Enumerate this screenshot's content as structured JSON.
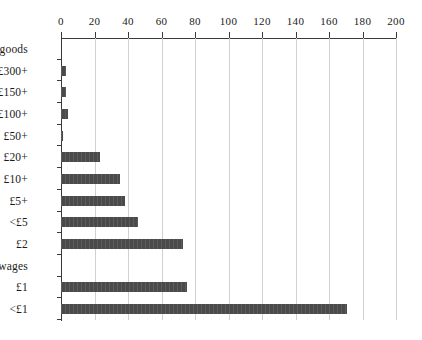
{
  "chart_data": {
    "type": "bar",
    "orientation": "horizontal",
    "title": "",
    "xlabel": "",
    "ylabel": "",
    "xlim": [
      0,
      200
    ],
    "xticks": [
      0,
      20,
      40,
      60,
      80,
      100,
      120,
      140,
      160,
      180,
      200
    ],
    "xtick_labels": [
      "0",
      "20",
      "40",
      "60",
      "80",
      "100",
      "120",
      "140",
      "160",
      "180",
      "200"
    ],
    "grid": "vertical",
    "legend": "none",
    "axis_position": "top",
    "bar_color": "#4a4a4a",
    "gridline_color": "#d0d0d0",
    "axis_color": "#3a3a3a",
    "categories": [
      "goods",
      "£300+",
      "£150+",
      "£100+",
      "£50+",
      "£20+",
      "£10+",
      "£5+",
      "<£5",
      "£2",
      "wages",
      "£1",
      "<£1"
    ],
    "values": [
      0,
      3,
      3,
      4,
      1,
      23,
      35,
      38,
      46,
      73,
      0,
      75,
      171
    ],
    "section_headers": [
      "goods",
      "wages"
    ]
  }
}
